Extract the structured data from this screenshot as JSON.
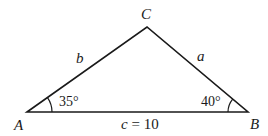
{
  "diagram": {
    "type": "triangle",
    "vertices": {
      "A": {
        "label": "A"
      },
      "B": {
        "label": "B"
      },
      "C": {
        "label": "C"
      }
    },
    "sides": {
      "a": {
        "label": "a"
      },
      "b": {
        "label": "b"
      },
      "c": {
        "label_var": "c",
        "label_rest": " = 10",
        "length": 10
      }
    },
    "angles": {
      "A": {
        "text": "35°",
        "degrees": 35
      },
      "B": {
        "text": "40°",
        "degrees": 40
      }
    },
    "colors": {
      "stroke": "#1a1a1a",
      "background": "#ffffff"
    }
  }
}
